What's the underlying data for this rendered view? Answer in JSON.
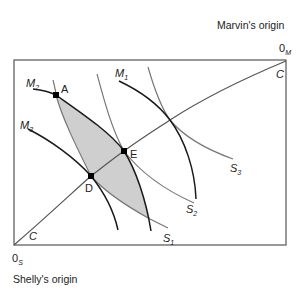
{
  "diagram": {
    "type": "edgeworth-box",
    "labels": {
      "marvin_origin": "Marvin's origin",
      "shelly_origin": "Shelly's origin",
      "origin_m_base": "0",
      "origin_m_sub": "M",
      "origin_s_base": "0",
      "origin_s_sub": "S",
      "contract_top": "C",
      "contract_bottom": "C"
    },
    "points": {
      "A": "A",
      "D": "D",
      "E": "E"
    },
    "marvin_curves": [
      {
        "base": "M",
        "sub": "1"
      },
      {
        "base": "M",
        "sub": "2"
      },
      {
        "base": "M",
        "sub": "3"
      }
    ],
    "shelly_curves": [
      {
        "base": "S",
        "sub": "1"
      },
      {
        "base": "S",
        "sub": "2"
      },
      {
        "base": "S",
        "sub": "3"
      }
    ],
    "colors": {
      "box": "#555555",
      "marvin_curve": "#1a1a1a",
      "shelly_curve": "#777777",
      "lens_fill": "#cfcfcf",
      "point": "#000000"
    }
  }
}
